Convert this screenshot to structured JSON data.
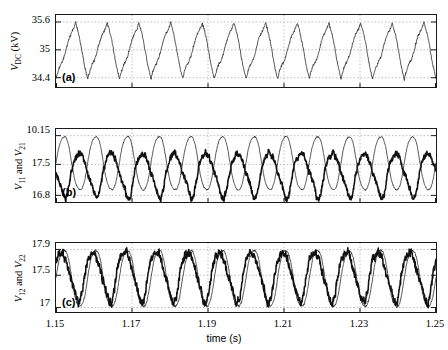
{
  "figure": {
    "width": 448,
    "height": 350,
    "background": "#ffffff",
    "trace_color": "#111111",
    "grid_color": "#b9b9b9",
    "axis_color": "#1a1a1a"
  },
  "xaxis": {
    "label": "time (s)",
    "ticks": [
      "1.15",
      "1.17",
      "1.19",
      "1.21",
      "1.23",
      "1.25"
    ],
    "min": 1.15,
    "max": 1.25
  },
  "panels": [
    {
      "tag": "(a)",
      "ylabel_main": "V",
      "ylabel_sub": "DC",
      "ylabel_unit": " (kV)",
      "yticks": [
        "35.6",
        "35",
        "34.4"
      ],
      "ymin": 34.2,
      "ymax": 35.75
    },
    {
      "tag": "(b)",
      "ylabel_main": "V",
      "ylabel_sub": "11",
      "ylabel_main2": "V",
      "ylabel_sub2": "21",
      "ylabel_conj": " and ",
      "yticks": [
        "10.15",
        "17.5",
        "16.8"
      ],
      "ymin": 16.65,
      "ymax": 18.3
    },
    {
      "tag": "(c)",
      "ylabel_main": "V",
      "ylabel_sub": "12",
      "ylabel_main2": "V",
      "ylabel_sub2": "22",
      "ylabel_conj": " and ",
      "yticks": [
        "17.9",
        "17.5",
        "17"
      ],
      "ymin": 16.93,
      "ymax": 18.0
    }
  ],
  "chart_data": {
    "type": "line",
    "title": "",
    "xlabel": "time (s)",
    "xlim": [
      1.15,
      1.25
    ],
    "grid": true,
    "legend": "none",
    "subplots": [
      {
        "id": "a",
        "tag": "(a)",
        "ylabel": "V_DC (kV)",
        "ylim": [
          34.2,
          35.75
        ],
        "yticks": [
          34.4,
          35,
          35.6
        ],
        "series": [
          {
            "name": "V_DC",
            "linewidth": "thin",
            "waveform": "ripple-sawtooth",
            "frequency_hz": 120,
            "cycles_in_window": 12,
            "mean": 35.0,
            "peak": 35.62,
            "trough": 34.38,
            "noise": 0.02
          }
        ]
      },
      {
        "id": "b",
        "tag": "(b)",
        "ylabel": "V_11 and V_21",
        "ylim": [
          16.65,
          18.3
        ],
        "yticks": [
          16.8,
          17.5,
          10.15
        ],
        "ytick_values_plotted": [
          16.8,
          17.5,
          18.15
        ],
        "series": [
          {
            "name": "V_11",
            "linewidth": "thick",
            "waveform": "quasi-sinusoid-noisy",
            "frequency_hz": 120,
            "cycles_in_window": 12,
            "mean": 17.48,
            "peak": 17.78,
            "trough": 16.82,
            "phase_deg": 180,
            "noise": 0.05
          },
          {
            "name": "V_21",
            "linewidth": "thin",
            "waveform": "sinusoid",
            "frequency_hz": 120,
            "cycles_in_window": 12,
            "mean": 17.5,
            "peak": 18.15,
            "trough": 16.9,
            "phase_deg": 0,
            "noise": 0.012
          }
        ]
      },
      {
        "id": "c",
        "tag": "(c)",
        "ylabel": "V_12 and V_22",
        "ylim": [
          16.93,
          18.0
        ],
        "yticks": [
          17,
          17.5,
          17.9
        ],
        "series": [
          {
            "name": "V_12",
            "linewidth": "thick",
            "waveform": "quasi-sinusoid-noisy",
            "frequency_hz": 120,
            "cycles_in_window": 12,
            "mean": 17.48,
            "peak": 17.88,
            "trough": 17.13,
            "phase_deg": 25,
            "noise": 0.045
          },
          {
            "name": "V_22",
            "linewidth": "thin",
            "waveform": "sinusoid",
            "frequency_hz": 120,
            "cycles_in_window": 12,
            "mean": 17.45,
            "peak": 17.9,
            "trough": 17.0,
            "phase_deg": 0,
            "noise": 0.012
          }
        ]
      }
    ]
  }
}
